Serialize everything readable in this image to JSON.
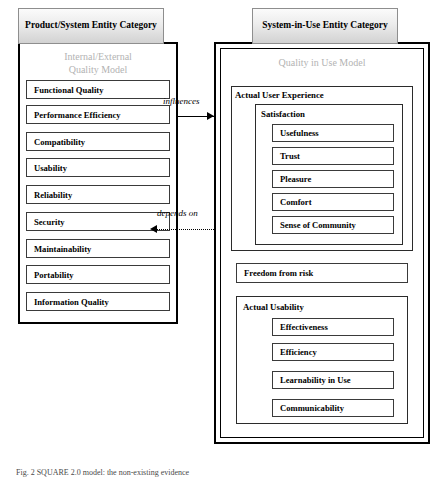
{
  "figure": {
    "caption": "Fig. 2 SQUARE 2.0 model: the non-existing evidence",
    "relations": {
      "influences": "influences",
      "depends_on": "depends on"
    }
  },
  "left_category": {
    "header": "Product/System Entity Category",
    "model_label_line1": "Internal/External",
    "model_label_line2": "Quality Model",
    "items": [
      "Functional Quality",
      "Performance Efficiency",
      "Compatibility",
      "Usability",
      "Reliability",
      "Security",
      "Maintainability",
      "Portability",
      "Information Quality"
    ]
  },
  "right_category": {
    "header": "System-in-Use Entity Category",
    "model_label": "Quality in Use Model",
    "groups": [
      {
        "title": "Actual User Experience",
        "subgroups": [
          {
            "title": "Satisfaction",
            "items": [
              "Usefulness",
              "Trust",
              "Pleasure",
              "Comfort",
              "Sense of Community"
            ]
          }
        ]
      }
    ],
    "standalone_item": "Freedom from risk",
    "usability_group": {
      "title": "Actual Usability",
      "items": [
        "Effectiveness",
        "Efficiency",
        "Learnability in Use",
        "Communicability"
      ]
    }
  }
}
